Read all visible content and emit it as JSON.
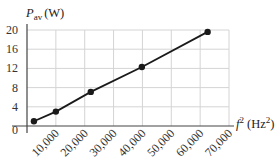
{
  "chart_data": {
    "type": "line",
    "title": "",
    "xlabel": "f² (Hz²)",
    "ylabel": "P_av (W)",
    "xlabel_parts": {
      "symbol": "f",
      "sup": "2",
      "unit": "(Hz",
      "unit_sup": "2",
      "unit_close": ")"
    },
    "ylabel_parts": {
      "symbol": "P",
      "sub": "av",
      "unit": "(W)"
    },
    "xlim": [
      0,
      70000
    ],
    "ylim": [
      0,
      20
    ],
    "x_ticks": [
      10000,
      20000,
      30000,
      40000,
      50000,
      60000,
      70000
    ],
    "x_tick_labels": [
      "10,000",
      "20,000",
      "30,000",
      "40,000",
      "50,000",
      "60,000",
      "70,000"
    ],
    "y_ticks": [
      0,
      4,
      8,
      12,
      16,
      20
    ],
    "y_tick_labels": [
      "0",
      "4",
      "8",
      "12",
      "16",
      "20"
    ],
    "grid": true,
    "legend": null,
    "series": [
      {
        "name": "P_av vs f²",
        "x": [
          2400,
          10000,
          22100,
          39800,
          62600
        ],
        "y": [
          1.0,
          3.0,
          7.1,
          12.3,
          19.6
        ],
        "markers": true,
        "color": "#1a1a1a"
      }
    ]
  },
  "colors": {
    "grid": "#d4d4d4",
    "axis": "#444444",
    "line": "#1a1a1a",
    "background": "#ffffff"
  }
}
